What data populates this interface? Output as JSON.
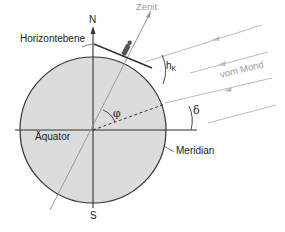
{
  "diagram": {
    "labels": {
      "north": "N",
      "south": "S",
      "zenith": "Zenit",
      "horizon_plane": "Horizontebene",
      "from_moon": "vom Mond",
      "equator": "Äquator",
      "meridian": "Meridian",
      "latitude_angle": "φ",
      "declination_angle": "δ",
      "altitude_angle_main": "h",
      "altitude_angle_sub": "K"
    },
    "colors": {
      "earth_fill": "#dcdcdc",
      "outline": "#333333",
      "ray_gray": "#b5b5b5",
      "label_gray": "#9a9a9a"
    }
  }
}
